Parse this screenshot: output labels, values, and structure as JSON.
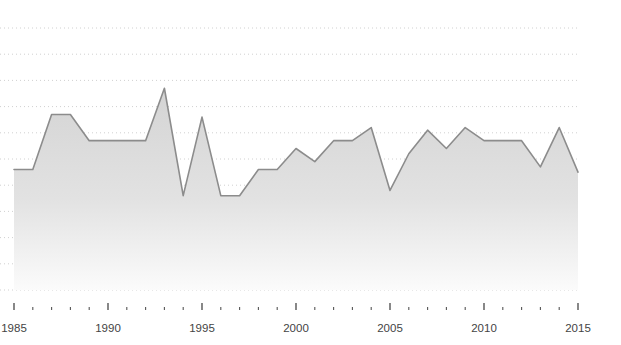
{
  "chart_data": {
    "type": "area",
    "title": "",
    "subtitle": "",
    "xlabel": "",
    "ylabel": "",
    "grid": true,
    "grid_style": "dotted-horizontal",
    "legend": "none",
    "xlim": [
      1985,
      2015
    ],
    "ylim": [
      0,
      10
    ],
    "x_tick_labels": [
      "1985",
      "1990",
      "1995",
      "2000",
      "2005",
      "2010",
      "2015"
    ],
    "x_major_ticks": [
      1985,
      1990,
      1995,
      2000,
      2005,
      2010,
      2015
    ],
    "x_minor_ticks": [
      1986,
      1987,
      1988,
      1989,
      1991,
      1992,
      1993,
      1994,
      1996,
      1997,
      1998,
      1999,
      2001,
      2002,
      2003,
      2004,
      2006,
      2007,
      2008,
      2009,
      2011,
      2012,
      2013,
      2014
    ],
    "y_tick_labels": [],
    "series": [
      {
        "name": "value",
        "x": [
          1985,
          1986,
          1987,
          1988,
          1989,
          1990,
          1991,
          1992,
          1993,
          1994,
          1995,
          1996,
          1997,
          1998,
          1999,
          2000,
          2001,
          2002,
          2003,
          2004,
          2005,
          2006,
          2007,
          2008,
          2009,
          2010,
          2011,
          2012,
          2013,
          2014,
          2015
        ],
        "values": [
          4.6,
          4.6,
          6.7,
          6.7,
          5.7,
          5.7,
          5.7,
          5.7,
          7.7,
          3.6,
          6.6,
          3.6,
          3.6,
          4.6,
          4.6,
          5.4,
          4.9,
          5.7,
          5.7,
          6.2,
          3.8,
          5.2,
          6.1,
          5.4,
          6.2,
          5.7,
          5.7,
          5.7,
          4.7,
          6.2,
          4.5
        ],
        "line_color": "#8c8c8c",
        "fill_color": "#d9d9d9"
      }
    ],
    "colors": {
      "line": "#8c8c8c",
      "fill_top": "#d6d6d6",
      "fill_bottom": "#f2f2f2",
      "grid": "#d0d0d0",
      "tick": "#555555",
      "label": "#444444",
      "background": "#ffffff"
    }
  },
  "axis": {
    "x_ticks": [
      {
        "label": "1985",
        "year": 1985,
        "major": true
      },
      {
        "label": "",
        "year": 1986,
        "major": false
      },
      {
        "label": "",
        "year": 1987,
        "major": false
      },
      {
        "label": "",
        "year": 1988,
        "major": false
      },
      {
        "label": "",
        "year": 1989,
        "major": false
      },
      {
        "label": "1990",
        "year": 1990,
        "major": true
      },
      {
        "label": "",
        "year": 1991,
        "major": false
      },
      {
        "label": "",
        "year": 1992,
        "major": false
      },
      {
        "label": "",
        "year": 1993,
        "major": false
      },
      {
        "label": "",
        "year": 1994,
        "major": false
      },
      {
        "label": "1995",
        "year": 1995,
        "major": true
      },
      {
        "label": "",
        "year": 1996,
        "major": false
      },
      {
        "label": "",
        "year": 1997,
        "major": false
      },
      {
        "label": "",
        "year": 1998,
        "major": false
      },
      {
        "label": "",
        "year": 1999,
        "major": false
      },
      {
        "label": "2000",
        "year": 2000,
        "major": true
      },
      {
        "label": "",
        "year": 2001,
        "major": false
      },
      {
        "label": "",
        "year": 2002,
        "major": false
      },
      {
        "label": "",
        "year": 2003,
        "major": false
      },
      {
        "label": "",
        "year": 2004,
        "major": false
      },
      {
        "label": "2005",
        "year": 2005,
        "major": true
      },
      {
        "label": "",
        "year": 2006,
        "major": false
      },
      {
        "label": "",
        "year": 2007,
        "major": false
      },
      {
        "label": "",
        "year": 2008,
        "major": false
      },
      {
        "label": "",
        "year": 2009,
        "major": false
      },
      {
        "label": "2010",
        "year": 2010,
        "major": true
      },
      {
        "label": "",
        "year": 2011,
        "major": false
      },
      {
        "label": "",
        "year": 2012,
        "major": false
      },
      {
        "label": "",
        "year": 2013,
        "major": false
      },
      {
        "label": "",
        "year": 2014,
        "major": false
      },
      {
        "label": "2015",
        "year": 2015,
        "major": true
      }
    ]
  },
  "geometry": {
    "plot_left": 14,
    "plot_right": 578,
    "plot_top": 18,
    "plot_bottom": 290,
    "axis_y": 310,
    "label_y": 332,
    "gridline_count": 11,
    "gridline_spacing": 26.2
  }
}
